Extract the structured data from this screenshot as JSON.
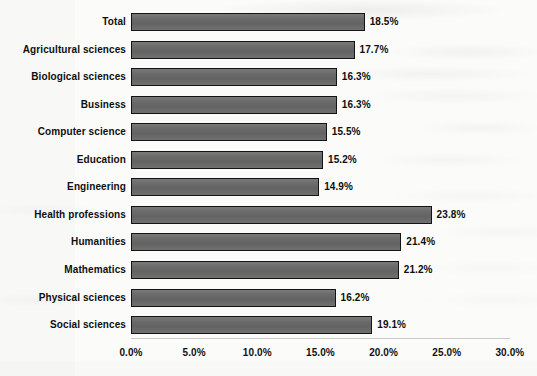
{
  "chart_data": {
    "type": "bar",
    "orientation": "horizontal",
    "title": "",
    "subtitle": "",
    "xlabel": "",
    "ylabel": "",
    "xlim": [
      0,
      30
    ],
    "xtick_labels": [
      "0.0%",
      "5.0%",
      "10.0%",
      "15.0%",
      "20.0%",
      "25.0%",
      "30.0%"
    ],
    "xticks": [
      0,
      5,
      10,
      15,
      20,
      25,
      30
    ],
    "grid": false,
    "legend": null,
    "unit": "%",
    "categories": [
      "Total",
      "Agricultural sciences",
      "Biological sciences",
      "Business",
      "Computer science",
      "Education",
      "Engineering",
      "Health professions",
      "Humanities",
      "Mathematics",
      "Physical sciences",
      "Social sciences"
    ],
    "values": [
      18.5,
      17.7,
      16.3,
      16.3,
      15.5,
      15.2,
      14.9,
      23.8,
      21.4,
      21.2,
      16.2,
      19.1
    ],
    "value_labels": [
      "18.5%",
      "17.7%",
      "16.3%",
      "16.3%",
      "15.5%",
      "15.2%",
      "14.9%",
      "23.8%",
      "21.4%",
      "21.2%",
      "16.2%",
      "19.1%"
    ],
    "bar_color": "#6b6b6b",
    "bar_border_color": "#141414",
    "background_color": "#fbfbfa",
    "text_color": "#0f0f0f"
  }
}
